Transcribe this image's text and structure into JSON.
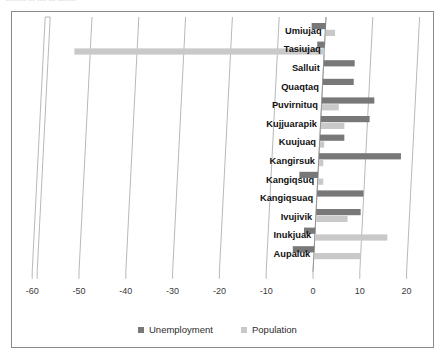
{
  "figure": {
    "cut_off_header": "......... ... ..., ... ........",
    "frame_border_color": "#8a8a8a"
  },
  "legend": {
    "position": "bottom-center",
    "entries": [
      {
        "label": "Unemployment",
        "color": "#787878",
        "swatch_name": "legend-swatch-unemployment"
      },
      {
        "label": "Population",
        "color": "#c9c9c9",
        "swatch_name": "legend-swatch-population"
      }
    ]
  },
  "chart_data": {
    "type": "bar",
    "orientation": "horizontal",
    "title": "",
    "subtitle": "",
    "xlabel": "",
    "ylabel": "",
    "xlim": [
      -60,
      20
    ],
    "xticks": [
      -60,
      -50,
      -40,
      -30,
      -20,
      -10,
      0,
      10,
      20
    ],
    "xtick_labels": [
      "-60",
      "-50",
      "-40",
      "-30",
      "-20",
      "-10",
      "0",
      "10",
      "20"
    ],
    "grid": true,
    "grid_axis": "x",
    "legend_position": "bottom",
    "categories": [
      "Umiujaq",
      "Tasiujaq",
      "Salluit",
      "Quaqtaq",
      "Puvirnituq",
      "Kujjuarapik",
      "Kuujuaq",
      "Kangirsuk",
      "Kangiqsuq",
      "Kangiqsuaq",
      "Ivujivik",
      "Inukjuak",
      "Aupaluk"
    ],
    "series": [
      {
        "name": "Unemployment",
        "color": "#787878",
        "values": [
          -3.0,
          -1.6,
          6.6,
          6.6,
          11.2,
          10.4,
          5.2,
          17.5,
          -4.0,
          9.9,
          9.5,
          -2.4,
          -4.6
        ]
      },
      {
        "name": "Population",
        "color": "#c9c9c9",
        "values": [
          2.0,
          -53.5,
          0.0,
          0.0,
          3.6,
          5.0,
          0.9,
          0.9,
          1.1,
          0.0,
          6.7,
          15.4,
          9.9
        ]
      }
    ]
  }
}
